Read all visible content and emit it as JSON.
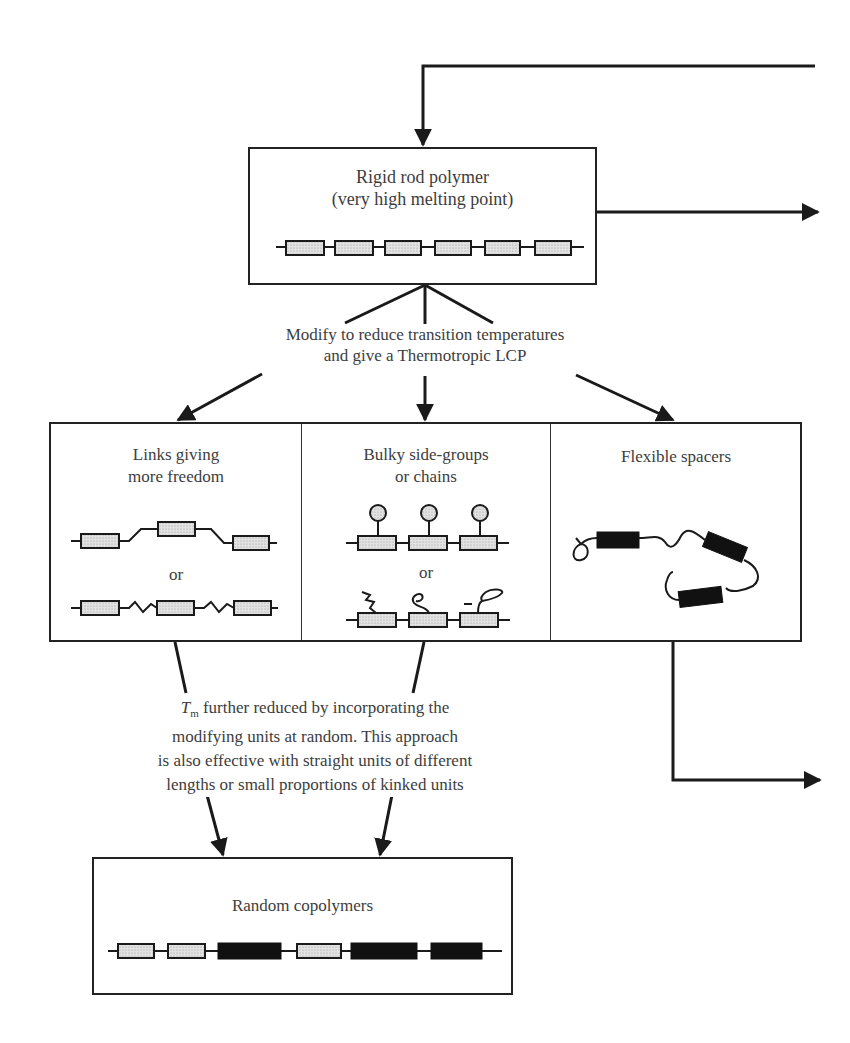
{
  "diagram": {
    "type": "flowchart",
    "top_box": {
      "title": "Rigid rod polymer",
      "subtitle": "(very high melting point)",
      "chain": {
        "units": 6,
        "unit_style": "stippled"
      }
    },
    "modify_caption": {
      "line1": "Modify to reduce transition temperatures",
      "line2": "and give a Thermotropic LCP"
    },
    "options": [
      {
        "title_line1": "Links giving",
        "title_line2": "more freedom",
        "separator": "or",
        "diagram_desc": "stippled units joined by kinked links / zig-zag links"
      },
      {
        "title_line1": "Bulky side-groups",
        "title_line2": "or chains",
        "separator": "or",
        "diagram_desc": "stippled units with circular side groups / flexible side chains"
      },
      {
        "title_line1": "Flexible spacers",
        "title_line2": "",
        "diagram_desc": "black rigid units joined by flexible coiled chain"
      }
    ],
    "random_caption": {
      "symbol": "T",
      "symbol_sub": "m",
      "line1_rest": " further reduced by incorporating the",
      "line2": "modifying units at random. This approach",
      "line3": "is also effective with straight units of different",
      "line4": "lengths or small proportions of kinked units"
    },
    "bottom_box": {
      "title": "Random copolymers",
      "chain": {
        "units": [
          "stippled",
          "stippled",
          "black",
          "stippled",
          "black",
          "black"
        ]
      }
    },
    "colors": {
      "line": "#1a1a1a",
      "text": "#3d3d3d",
      "stipple": "#d6d6d6",
      "solid_unit": "#111111"
    }
  }
}
